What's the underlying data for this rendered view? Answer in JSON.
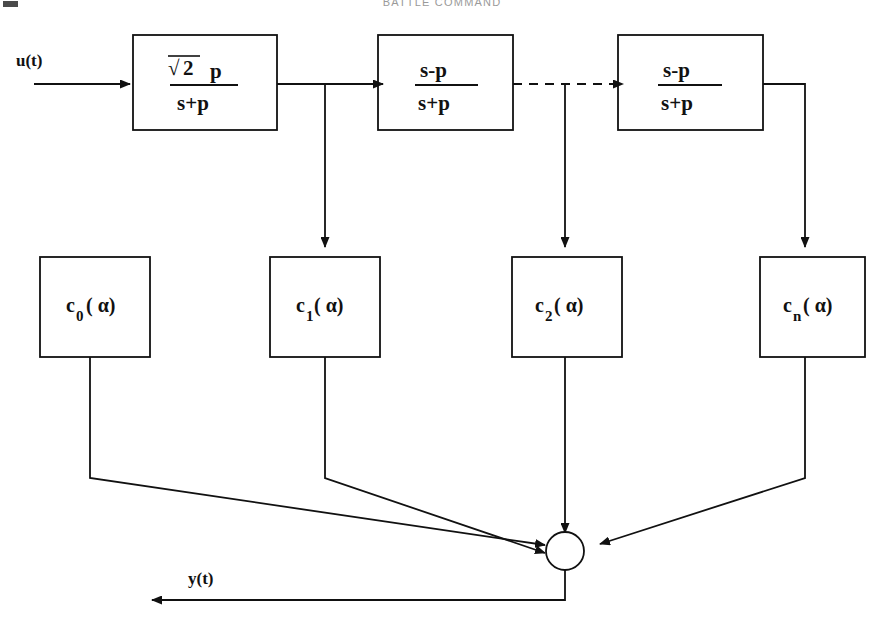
{
  "page": {
    "header_text": "BATTLE COMMAND",
    "width": 884,
    "height": 640,
    "background": "#ffffff",
    "line_color": "#111111",
    "header_color": "#9a9a9a"
  },
  "signals": {
    "input_label": "u(t)",
    "output_label": "y(t)"
  },
  "filter_blocks": [
    {
      "id": "laguerre-first-block",
      "numerator": "2",
      "numerator_prefix": "√",
      "numerator_suffix": "p",
      "denominator": "s+p",
      "has_radical": true
    },
    {
      "id": "allpass-block-1",
      "numerator": "s-p",
      "denominator": "s+p",
      "has_radical": false
    },
    {
      "id": "allpass-block-n",
      "numerator": "s-p",
      "denominator": "s+p",
      "has_radical": false
    }
  ],
  "coefficient_blocks": [
    {
      "id": "coef-0",
      "symbol": "c",
      "subscript": "0",
      "argument": "( α)"
    },
    {
      "id": "coef-1",
      "symbol": "c",
      "subscript": "1",
      "argument": "( α)"
    },
    {
      "id": "coef-2",
      "symbol": "c",
      "subscript": "2",
      "argument": "( α)"
    },
    {
      "id": "coef-n",
      "symbol": "c",
      "subscript": "n",
      "argument": "( α)"
    }
  ],
  "summing_junction": {
    "id": "summing-junction",
    "shape": "circle",
    "incoming_count": 4
  },
  "connector_style": {
    "solid": "solid",
    "elided": "dashed"
  }
}
